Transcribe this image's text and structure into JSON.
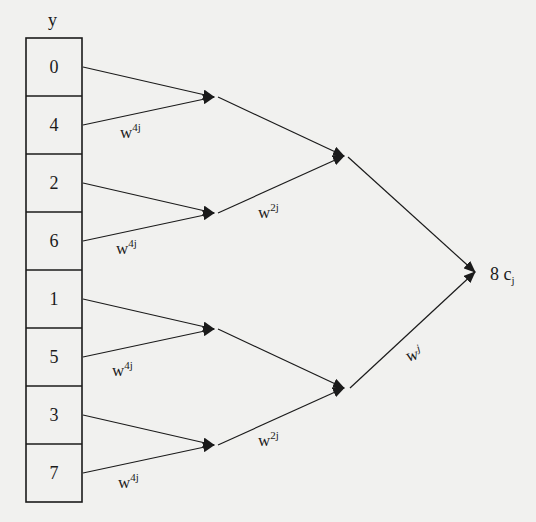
{
  "diagram": {
    "array_label": "y",
    "cells": [
      "0",
      "4",
      "2",
      "6",
      "1",
      "5",
      "3",
      "7"
    ],
    "stage1_weights": [
      {
        "base": "w",
        "exp": "4j"
      },
      {
        "base": "w",
        "exp": "4j"
      },
      {
        "base": "w",
        "exp": "4j"
      },
      {
        "base": "w",
        "exp": "4j"
      }
    ],
    "stage2_weights": [
      {
        "base": "w",
        "exp": "2j"
      },
      {
        "base": "w",
        "exp": "2j"
      }
    ],
    "stage3_weights": [
      {
        "base": "w",
        "exp": "j"
      }
    ],
    "output": {
      "coefficient": "8",
      "symbol": "c",
      "subscript": "j"
    },
    "colors": {
      "background": "#f1f1ef",
      "ink": "#1b1b1b"
    }
  }
}
